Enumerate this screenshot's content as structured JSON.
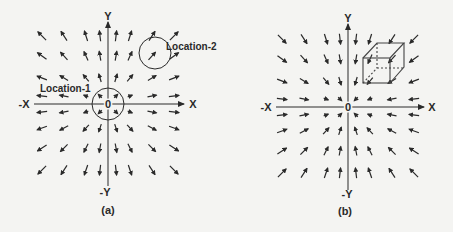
{
  "figure": {
    "panels": [
      {
        "id": "a",
        "caption": "(a)",
        "axis_labels": {
          "pos_x": "X",
          "neg_x": "-X",
          "pos_y": "Y",
          "neg_y": "-Y",
          "origin": "0"
        },
        "field_type": "divergent",
        "annotations": [
          {
            "label": "Location-1",
            "shape": "circle",
            "at": "origin"
          },
          {
            "label": "Location-2",
            "shape": "circle",
            "at": "upper-right quadrant"
          }
        ]
      },
      {
        "id": "b",
        "caption": "(b)",
        "axis_labels": {
          "pos_x": "X",
          "neg_x": "-X",
          "pos_y": "Y",
          "neg_y": "-Y",
          "origin": "0"
        },
        "field_type": "convergent",
        "annotations": [
          {
            "label": "",
            "shape": "cube",
            "at": "upper-right quadrant"
          }
        ]
      }
    ],
    "colors": {
      "ink": "#2a2a2a",
      "background": "#f4f4f2"
    }
  }
}
